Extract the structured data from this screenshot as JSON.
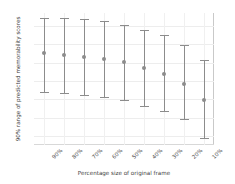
{
  "chart_data": {
    "type": "line",
    "title": "",
    "xlabel": "Percentage size of original frame",
    "ylabel": "90% range of predicted memorability scores",
    "categories": [
      "90%",
      "80%",
      "70%",
      "60%",
      "50%",
      "40%",
      "30%",
      "20%",
      "10%"
    ],
    "series": [
      {
        "name": "predicted memorability",
        "values": [
          0.775,
          0.77,
          0.766,
          0.759,
          0.75,
          0.735,
          0.719,
          0.692,
          0.648
        ],
        "lower": [
          0.668,
          0.664,
          0.659,
          0.653,
          0.645,
          0.629,
          0.614,
          0.592,
          0.54
        ],
        "upper": [
          0.872,
          0.871,
          0.869,
          0.862,
          0.853,
          0.84,
          0.825,
          0.797,
          0.757
        ]
      }
    ],
    "yticks": [
      0.85,
      0.8,
      0.75,
      0.7,
      0.65,
      0.6,
      0.55
    ],
    "ytick_labels": [
      "0.85",
      "0.80",
      "0.75",
      "0.70",
      "0.65",
      "0.60",
      "0.55"
    ],
    "ylim": [
      0.525,
      0.885
    ],
    "grid": true,
    "legend": "none",
    "marker": "point",
    "errorbar_style": "capped",
    "colors": {
      "errorbar": "#8c8c8c",
      "grid": "#ededed",
      "text": "#3d3d3d",
      "background": "#ffffff"
    }
  }
}
